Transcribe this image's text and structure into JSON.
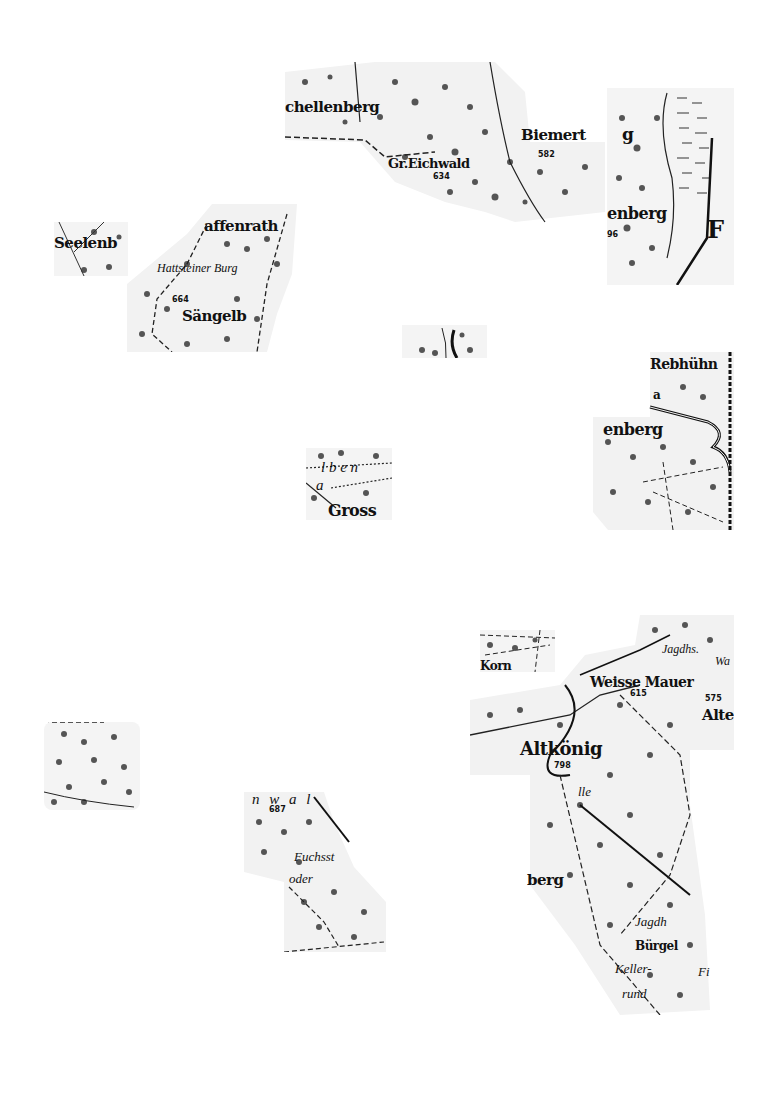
{
  "map": {
    "type": "historic topographic map fragments (forest stipple, Taunus region)",
    "colors": {
      "ink": "#111111",
      "paper": "#ffffff",
      "stipple": "#555555"
    },
    "fragments": [
      {
        "id": "f1",
        "labels": {
          "a": "chellenberg",
          "b": "Gr.Eichwald",
          "c": "634",
          "d": "Biemert",
          "e": "582"
        }
      },
      {
        "id": "f2",
        "labels": {
          "a": "g",
          "b": "enberg",
          "c": "96",
          "d": "F"
        }
      },
      {
        "id": "f3",
        "labels": {
          "a": "Seelenb"
        }
      },
      {
        "id": "f4",
        "labels": {
          "a": "affenrath",
          "b": "Hattsteiner Burg",
          "c": "664",
          "d": "Sängelb"
        }
      },
      {
        "id": "f5",
        "labels": {}
      },
      {
        "id": "f6",
        "labels": {
          "a": "Rebhühn",
          "b": "a",
          "c": "enberg"
        }
      },
      {
        "id": "f7",
        "labels": {
          "a": "l b e n",
          "b": "Gross",
          "c": "a"
        }
      },
      {
        "id": "f8",
        "labels": {
          "a": "Korn"
        }
      },
      {
        "id": "f9",
        "labels": {
          "a": "Jagdhs.",
          "b": "Wa",
          "c": "Weisse Mauer",
          "d": "615",
          "e": "575",
          "f": "Alte",
          "g": "Altkönig",
          "h": "798",
          "i": "lle",
          "j": "berg",
          "k": "Jagdh",
          "l": "Bürgel",
          "m": "Keller-",
          "n": "Fi",
          "o": "rund"
        }
      },
      {
        "id": "f10",
        "labels": {}
      },
      {
        "id": "f11",
        "labels": {
          "a": "n w a l",
          "b": "687",
          "c": "Fuchsst",
          "d": "oder"
        }
      }
    ]
  }
}
